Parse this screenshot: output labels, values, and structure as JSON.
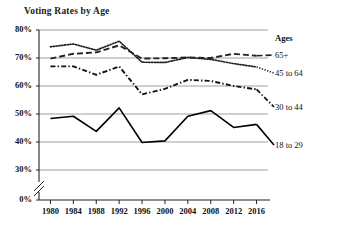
{
  "chart_data": {
    "type": "line",
    "title": "Voting Rates by Age",
    "xlabel": "",
    "ylabel": "",
    "categories": [
      1980,
      1984,
      1988,
      1992,
      1996,
      2000,
      2004,
      2008,
      2012,
      2016
    ],
    "x_tick_labels": [
      "1980",
      "1984",
      "1988",
      "1992",
      "1996",
      "2000",
      "2004",
      "2008",
      "2012",
      "2016"
    ],
    "y_tick_labels": [
      "80%",
      "70%",
      "60%",
      "50%",
      "40%",
      "30%",
      "0%"
    ],
    "y_tick_values": [
      80,
      70,
      60,
      50,
      40,
      30,
      0
    ],
    "ylim": [
      30,
      80
    ],
    "axis_break": true,
    "grid": true,
    "legend_position": "right",
    "legend_title": "Ages",
    "series": [
      {
        "name": "65+",
        "style": "dashed",
        "color": "#222222",
        "values": [
          69.8,
          71.5,
          72.0,
          74.5,
          69.8,
          69.9,
          70.2,
          70.0,
          71.5,
          70.8
        ]
      },
      {
        "name": "45 to 64",
        "style": "dotted",
        "color": "#222222",
        "values": [
          74.0,
          75.0,
          72.8,
          76.0,
          68.5,
          68.4,
          70.2,
          69.5,
          68.0,
          66.8
        ]
      },
      {
        "name": "30 to 44",
        "style": "dashdot",
        "color": "#111111",
        "values": [
          67.0,
          67.0,
          64.0,
          67.0,
          57.0,
          59.0,
          62.2,
          61.8,
          60.0,
          58.8
        ]
      },
      {
        "name": "18 to 29",
        "style": "solid",
        "color": "#000000",
        "values": [
          48.4,
          49.2,
          43.8,
          52.2,
          39.8,
          40.4,
          49.2,
          51.2,
          45.2,
          46.3
        ]
      }
    ]
  },
  "legend": {
    "title": "Ages",
    "items": [
      {
        "label": "65+"
      },
      {
        "label": "45 to 64"
      },
      {
        "label": "30 to 44"
      },
      {
        "label": "18 to 29"
      }
    ]
  }
}
